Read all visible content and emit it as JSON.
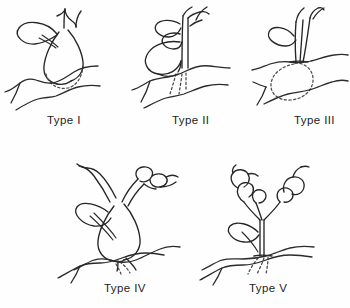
{
  "figure": {
    "background_color": "#fefefe",
    "ink_color": "#262626",
    "buried_outline_color": "#4a4a4a",
    "buried_line_style": "dashed",
    "ground_line_style": "solid",
    "panel_count": 5,
    "row_counts": [
      3,
      2
    ]
  },
  "panels": [
    {
      "id": "type-1",
      "label": "Type I",
      "row": 1,
      "column": 1,
      "organ_position": "at ground level",
      "organ_shape": "rounded bulb, partly buried",
      "buried_outline": "dashed lower bulb arc",
      "appendages": "one looped leaf to the left, forked shoot at apex"
    },
    {
      "id": "type-2",
      "label": "Type II",
      "row": 1,
      "column": 2,
      "organ_position": "above ground level",
      "organ_shape": "large open ring / coiled loop",
      "buried_outline": "short dashed roots below ground",
      "appendages": "two leaves left of stem, forked shoot at apex"
    },
    {
      "id": "type-3",
      "label": "Type III",
      "row": 1,
      "column": 3,
      "organ_position": "below ground level",
      "organ_shape": "ovoid tuber, fully buried",
      "buried_outline": "dashed ovoid tuber outline",
      "appendages": "one looped leaf, forked shoot at apex"
    },
    {
      "id": "type-4",
      "label": "Type IV",
      "row": 2,
      "column": 1,
      "organ_position": "above ground level",
      "organ_shape": "large pendant bulb on short buried stalk",
      "buried_outline": "small dashed root tip",
      "appendages": "three branching arms with terminal swellings"
    },
    {
      "id": "type-5",
      "label": "Type V",
      "row": 2,
      "column": 2,
      "organ_position": "above ground level",
      "organ_shape": "branched aerial stem bearing chains of bulbils",
      "buried_outline": "slender dashed root below ground",
      "appendages": "two bulbil-bearing branches plus a basal leaf"
    }
  ]
}
